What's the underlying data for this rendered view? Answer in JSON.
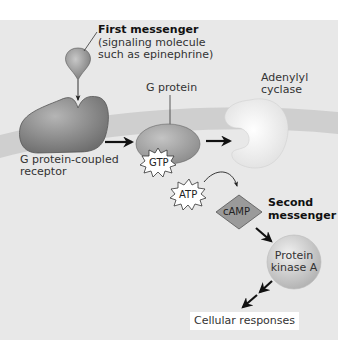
{
  "first_messenger": {
    "title": "First messenger",
    "desc_line1": "(signaling molecule",
    "desc_line2": "such as epinephrine)"
  },
  "receptor": {
    "line1": "G protein-coupled",
    "line2": "receptor"
  },
  "g_protein": {
    "label": "G protein",
    "badge": "GTP"
  },
  "adenylyl_cyclase": {
    "line1": "Adenylyl",
    "line2": "cyclase"
  },
  "atp": {
    "label": "ATP"
  },
  "camp": {
    "label": "cAMP"
  },
  "second_messenger": {
    "line1": "Second",
    "line2": "messenger"
  },
  "protein_kinase": {
    "line1": "Protein",
    "line2": "kinase A"
  },
  "cellular_responses": {
    "label": "Cellular responses"
  },
  "colors": {
    "panel": "#e8e8e8",
    "membrane": "#cfcfcf",
    "receptor": "#8a8a8a",
    "g_protein": "#a8a8a8",
    "cyclase": "#f7f7f7",
    "camp": "#9a9a9a",
    "kinase": "#cccccc",
    "arrow": "#111111"
  }
}
